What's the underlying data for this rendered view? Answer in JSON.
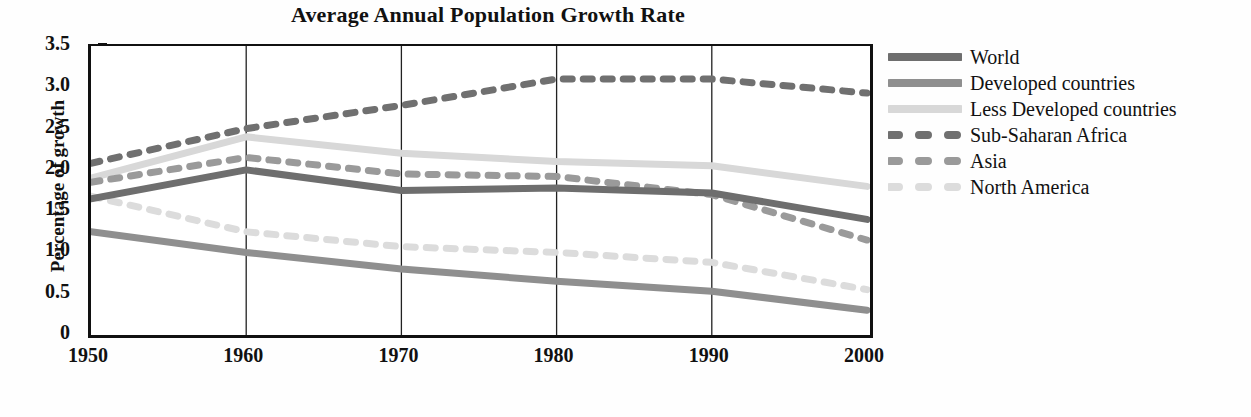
{
  "chart_data": {
    "type": "line",
    "title": "Average Annual Population Growth Rate",
    "xlabel": "",
    "ylabel": "Percentage of growth",
    "x": [
      1950,
      1960,
      1970,
      1980,
      1990,
      2000
    ],
    "xtick_labels": [
      "1950",
      "1960",
      "1970",
      "1980",
      "1990",
      "2000"
    ],
    "ytick_labels": [
      "0",
      "0.5",
      "1.0",
      "1.5",
      "2.0",
      "2.5",
      "3.0",
      "3.5"
    ],
    "ytick_values": [
      0,
      0.5,
      1.0,
      1.5,
      2.0,
      2.5,
      3.0,
      3.5
    ],
    "xlim": [
      1950,
      2000
    ],
    "ylim": [
      0,
      3.5
    ],
    "grid": "vertical-only",
    "legend_position": "right",
    "series": [
      {
        "name": "World",
        "style": "solid",
        "color": "#6e6e6e",
        "values": [
          1.65,
          2.0,
          1.75,
          1.78,
          1.72,
          1.4
        ]
      },
      {
        "name": "Developed countries",
        "style": "solid",
        "color": "#8f8f8f",
        "values": [
          1.25,
          1.0,
          0.8,
          0.65,
          0.53,
          0.3
        ]
      },
      {
        "name": "Less Developed countries",
        "style": "solid",
        "color": "#d8d8d8",
        "values": [
          1.9,
          2.4,
          2.2,
          2.1,
          2.05,
          1.8
        ]
      },
      {
        "name": "Sub-Saharan Africa",
        "style": "dotted",
        "color": "#707070",
        "values": [
          2.08,
          2.5,
          2.78,
          3.1,
          3.1,
          2.93
        ]
      },
      {
        "name": "Asia",
        "style": "dotted",
        "color": "#9a9a9a",
        "values": [
          1.85,
          2.15,
          1.95,
          1.92,
          1.7,
          1.15
        ]
      },
      {
        "name": "North America",
        "style": "dotted",
        "color": "#dcdcdc",
        "values": [
          1.68,
          1.25,
          1.07,
          1.0,
          0.88,
          0.55
        ]
      }
    ]
  },
  "legend": {
    "items": [
      {
        "label": "World",
        "style": "solid",
        "color": "#6e6e6e"
      },
      {
        "label": "Developed countries",
        "style": "solid",
        "color": "#8f8f8f"
      },
      {
        "label": "Less Developed countries",
        "style": "solid",
        "color": "#d8d8d8"
      },
      {
        "label": "Sub-Saharan Africa",
        "style": "dotted",
        "color": "#707070"
      },
      {
        "label": "Asia",
        "style": "dotted",
        "color": "#9a9a9a"
      },
      {
        "label": "North America",
        "style": "dotted",
        "color": "#dcdcdc"
      }
    ]
  },
  "axis_color": "#111111"
}
